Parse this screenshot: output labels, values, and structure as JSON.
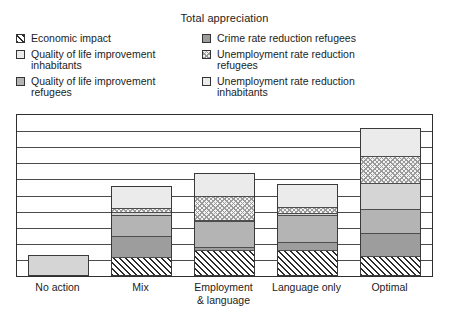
{
  "chart_data": {
    "type": "bar",
    "title": "Total appreciation",
    "xlabel": "",
    "ylabel": "",
    "stacked": true,
    "grid": true,
    "legend_position": "top",
    "ylim": [
      0,
      9
    ],
    "gridline_count": 9,
    "categories": [
      "No action",
      "Mix",
      "Employment\n& language",
      "Language only",
      "Optimal"
    ],
    "series": [
      {
        "name": "Economic impact",
        "pattern": "diagonal-hatch",
        "values": [
          0,
          1.0,
          1.35,
          1.35,
          1.0
        ]
      },
      {
        "name": "Crime rate reduction refugees",
        "pattern": "dark-gray",
        "values": [
          0,
          1.2,
          0.18,
          0.5,
          1.3
        ]
      },
      {
        "name": "Quality of life improvement refugees",
        "pattern": "medium-gray",
        "values": [
          0,
          1.15,
          1.5,
          1.55,
          1.4
        ]
      },
      {
        "name": "Quality of life improvement inhabitants",
        "pattern": "light-gray",
        "values": [
          1.15,
          0.2,
          0.05,
          0.1,
          1.45
        ]
      },
      {
        "name": "Unemployment rate reduction refugees",
        "pattern": "checker",
        "values": [
          0,
          0.2,
          1.35,
          0.35,
          1.55
        ]
      },
      {
        "name": "Unemployment rate reduction inhabitants",
        "pattern": "white",
        "values": [
          0,
          1.3,
          1.35,
          1.3,
          1.55
        ]
      }
    ]
  },
  "legend": {
    "left_column": [
      {
        "label": "Economic impact",
        "pattern": "diagonal-hatch"
      },
      {
        "label": "Quality of life improvement\ninhabitants",
        "pattern": "white"
      },
      {
        "label": "Quality of life improvement\nrefugees",
        "pattern": "medium-gray"
      }
    ],
    "right_column": [
      {
        "label": "Crime rate reduction refugees",
        "pattern": "dark-gray"
      },
      {
        "label": "Unemployment rate reduction\nrefugees",
        "pattern": "checker"
      },
      {
        "label": "Unemployment rate reduction\ninhabitants",
        "pattern": "white"
      }
    ]
  },
  "colors": {
    "dark_gray": "#9d9d9d",
    "medium_gray": "#b4b4b4",
    "light_gray": "#d5d5d5",
    "white": "#ebebeb",
    "line": "#2f2f2f",
    "text": "#1c1c1c"
  }
}
